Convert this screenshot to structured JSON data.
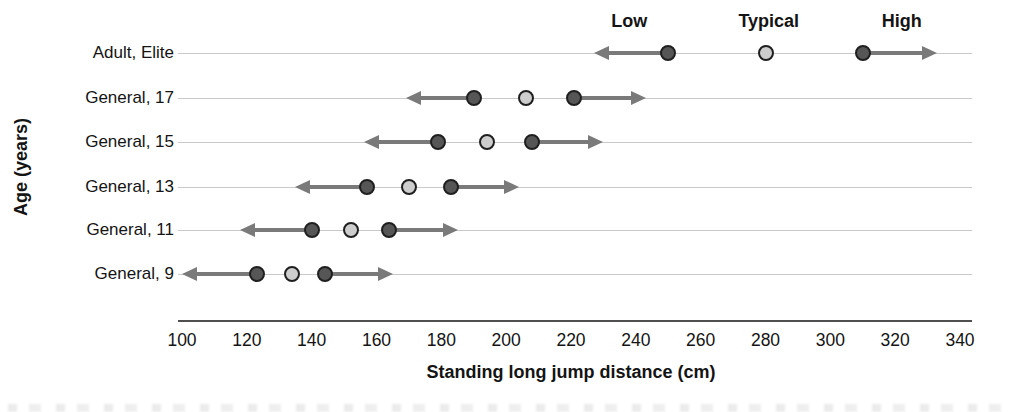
{
  "chart_data": {
    "type": "scatter",
    "title": "",
    "xlabel": "Standing long jump distance (cm)",
    "ylabel": "Age (years)",
    "xlim": [
      100,
      340
    ],
    "xticks": [
      100,
      120,
      140,
      160,
      180,
      200,
      220,
      240,
      260,
      280,
      300,
      320,
      340
    ],
    "categories": [
      "Adult, Elite",
      "General, 17",
      "General, 15",
      "General, 13",
      "General, 11",
      "General, 9"
    ],
    "series": [
      {
        "name": "Low",
        "marker": "dark-filled-circle",
        "values": [
          250,
          190,
          179,
          157,
          140,
          123
        ]
      },
      {
        "name": "Typical",
        "marker": "light-filled-circle",
        "values": [
          280,
          206,
          194,
          170,
          152,
          134
        ]
      },
      {
        "name": "High",
        "marker": "dark-filled-circle",
        "values": [
          310,
          221,
          208,
          183,
          164,
          144
        ]
      }
    ],
    "range_arrows": [
      {
        "category": "Adult, Elite",
        "left_end": 227,
        "right_end": 333
      },
      {
        "category": "General, 17",
        "left_end": 169,
        "right_end": 243
      },
      {
        "category": "General, 15",
        "left_end": 156,
        "right_end": 230
      },
      {
        "category": "General, 13",
        "left_end": 135,
        "right_end": 204
      },
      {
        "category": "General, 11",
        "left_end": 118,
        "right_end": 185
      },
      {
        "category": "General, 9",
        "left_end": 100,
        "right_end": 165
      }
    ],
    "legend_labels": [
      "Low",
      "Typical",
      "High"
    ],
    "legend_anchors_x_cm": [
      238,
      281,
      322
    ],
    "legend_position": "top-above-first-row",
    "grid": "light-horizontal-row-lines",
    "colors": {
      "dark_dot": "#565656",
      "light_dot": "#cdcdcd",
      "dot_border": "#1f1f1f",
      "arrow": "#7a7a7a",
      "row_line": "#c9c9c9",
      "axis_line": "#4f4f4f",
      "text": "#141414",
      "background": "#ffffff"
    }
  }
}
